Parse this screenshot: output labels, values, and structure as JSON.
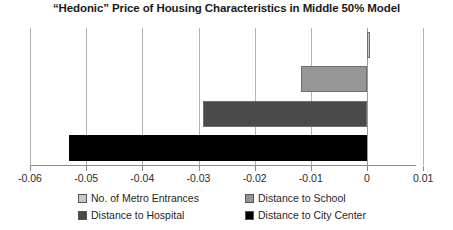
{
  "chart_data": {
    "type": "bar",
    "orientation": "horizontal",
    "title": "“Hedonic” Price of Housing Characteristics in Middle 50% Model",
    "xlabel": "",
    "ylabel": "",
    "xlim": [
      -0.06,
      0.01
    ],
    "xticks": [
      -0.06,
      -0.05,
      -0.04,
      -0.03,
      -0.02,
      -0.01,
      0,
      0.01
    ],
    "xticklabels": [
      "-0.06",
      "-0.05",
      "-0.04",
      "-0.03",
      "-0.02",
      "-0.01",
      "0",
      "0.01"
    ],
    "grid": true,
    "grid_axis": "x",
    "legend_position": "bottom",
    "categories": [
      "No. of Metro Entrances",
      "Distance to School",
      "Distance to Hospital",
      "Distance to City Center"
    ],
    "values": [
      0.0005,
      -0.0118,
      -0.0292,
      -0.053
    ],
    "colors": [
      "#c8c8c8",
      "#969696",
      "#4a4a4a",
      "#000000"
    ],
    "series": [
      {
        "name": "No. of Metro Entrances",
        "value": 0.0005,
        "color": "#c8c8c8"
      },
      {
        "name": "Distance to School",
        "value": -0.0118,
        "color": "#969696"
      },
      {
        "name": "Distance to Hospital",
        "value": -0.0292,
        "color": "#4a4a4a"
      },
      {
        "name": "Distance to City Center",
        "value": -0.053,
        "color": "#000000"
      }
    ]
  },
  "legend": {
    "entries": [
      {
        "label": "No. of Metro Entrances",
        "color": "#c8c8c8"
      },
      {
        "label": "Distance to School",
        "color": "#969696"
      },
      {
        "label": "Distance to Hospital",
        "color": "#4a4a4a"
      },
      {
        "label": "Distance to City Center",
        "color": "#000000"
      }
    ]
  }
}
